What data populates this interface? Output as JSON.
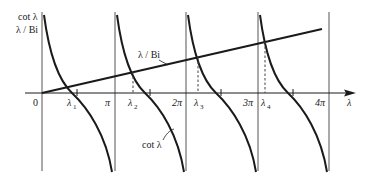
{
  "diagram": {
    "type": "function-plot",
    "y_axis_label_line1": "cot λ",
    "y_axis_label_line2": "λ / Bi",
    "x_axis_label": "λ",
    "origin_label": "0",
    "line_label": "λ / Bi",
    "curve_label": "cot λ",
    "tick_labels": [
      "π",
      "2π",
      "3π",
      "4π"
    ],
    "root_labels": [
      "λ",
      "λ",
      "λ",
      "λ"
    ],
    "root_subscripts": [
      "1",
      "2",
      "3",
      "4"
    ],
    "colors": {
      "ink": "#1a1a1a",
      "asymptote": "#555555",
      "background": "#ffffff"
    }
  }
}
